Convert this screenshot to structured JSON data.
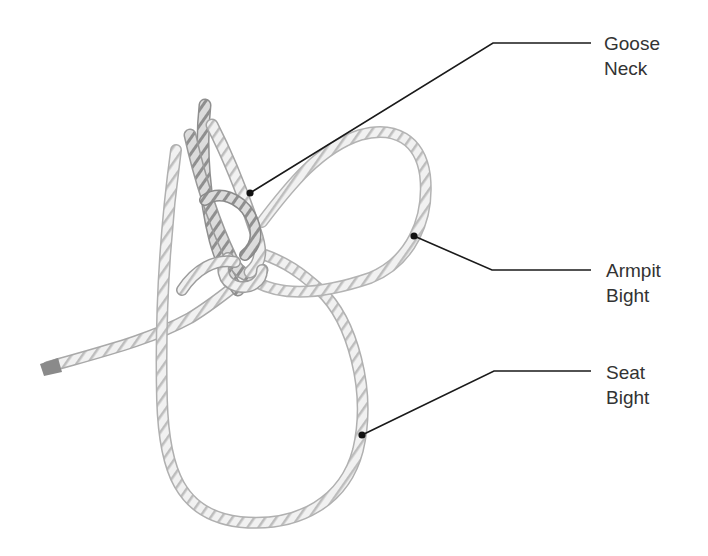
{
  "diagram": {
    "colors": {
      "background": "#ffffff",
      "rope_light": "#f2f2f2",
      "rope_mid": "#cfcfcf",
      "rope_dark": "#8e8e8e",
      "leader_line": "#1a1a1a",
      "label_text": "#333333"
    },
    "labels": [
      {
        "id": "goose-neck",
        "line1": "Goose",
        "line2": "Neck",
        "anchor_point": [
          250,
          193
        ],
        "elbow_point": [
          493,
          43
        ],
        "line_end": [
          591,
          43
        ]
      },
      {
        "id": "armpit-bight",
        "line1": "Armpit",
        "line2": "Bight",
        "anchor_point": [
          414,
          236
        ],
        "elbow_point": [
          492,
          270
        ],
        "line_end": [
          591,
          270
        ]
      },
      {
        "id": "seat-bight",
        "line1": "Seat",
        "line2": "Bight",
        "anchor_point": [
          362,
          435
        ],
        "elbow_point": [
          494,
          371
        ],
        "line_end": [
          591,
          371
        ]
      }
    ]
  }
}
